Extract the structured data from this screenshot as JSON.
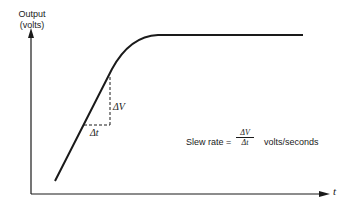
{
  "y_axis": {
    "label_line1": "Output",
    "label_line2": "(volts)"
  },
  "x_axis": {
    "label": "t"
  },
  "annotations": {
    "delta_v": "ΔV",
    "delta_t": "Δt",
    "formula_prefix": "Slew rate =",
    "formula_numerator": "ΔV",
    "formula_denominator": "Δt",
    "formula_units": "volts/seconds"
  },
  "colors": {
    "stroke": "#1a1a1a",
    "background": "#ffffff"
  }
}
